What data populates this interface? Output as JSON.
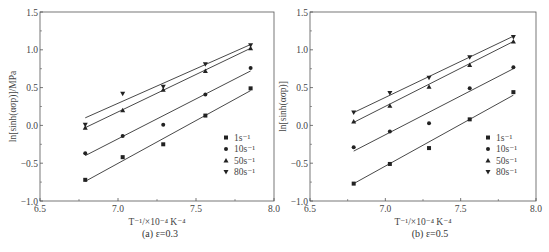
{
  "chart_data": [
    {
      "type": "scatter",
      "panel": "(a)",
      "caption": "(a) ε=0.3",
      "title": "",
      "xlabel": "T⁻¹/×10⁻⁴ K⁻⁴",
      "ylabel": "ln[sinh(ασp)]/MPa",
      "xlim": [
        6.5,
        8.0
      ],
      "ylim": [
        -1.0,
        1.5
      ],
      "xticks": [
        "6.5",
        "7.0",
        "7.5",
        "8.0"
      ],
      "yticks": [
        "-1.0",
        "-0.5",
        "0.0",
        "0.5",
        "1.0",
        "1.5"
      ],
      "grid": false,
      "legend_position": "lower right",
      "fit_lines": true,
      "x": [
        6.79,
        7.03,
        7.29,
        7.56,
        7.85
      ],
      "series": [
        {
          "name": "1s⁻¹",
          "marker": "square",
          "values": [
            -0.72,
            -0.42,
            -0.25,
            0.13,
            0.49
          ],
          "fit": [
            -0.74,
            0.46
          ]
        },
        {
          "name": "10s⁻¹",
          "marker": "circle",
          "values": [
            -0.37,
            -0.14,
            0.01,
            0.41,
            0.76
          ],
          "fit": [
            -0.4,
            0.72
          ]
        },
        {
          "name": "50s⁻¹",
          "marker": "triangle-up",
          "values": [
            -0.03,
            0.2,
            0.47,
            0.72,
            1.02
          ],
          "fit": [
            -0.03,
            1.02
          ]
        },
        {
          "name": "80s⁻¹",
          "marker": "triangle-down",
          "values": [
            0.01,
            0.42,
            0.51,
            0.81,
            1.06
          ],
          "fit": [
            0.1,
            1.07
          ]
        }
      ]
    },
    {
      "type": "scatter",
      "panel": "(b)",
      "caption": "(b) ε=0.5",
      "title": "",
      "xlabel": "T⁻¹/×10⁻⁴ K⁻⁴",
      "ylabel": "ln[sinh(ασp)]",
      "xlim": [
        6.5,
        8.0
      ],
      "ylim": [
        -1.0,
        1.5
      ],
      "xticks": [
        "6.5",
        "7.0",
        "7.5",
        "8.0"
      ],
      "yticks": [
        "-1.0",
        "-0.5",
        "0.0",
        "0.5",
        "1.0",
        "1.5"
      ],
      "grid": false,
      "legend_position": "lower right",
      "fit_lines": true,
      "x": [
        6.79,
        7.03,
        7.29,
        7.56,
        7.85
      ],
      "series": [
        {
          "name": "1s⁻¹",
          "marker": "square",
          "values": [
            -0.77,
            -0.51,
            -0.3,
            0.08,
            0.44
          ],
          "fit": [
            -0.77,
            0.4
          ]
        },
        {
          "name": "10s⁻¹",
          "marker": "circle",
          "values": [
            -0.29,
            -0.08,
            0.03,
            0.49,
            0.77
          ],
          "fit": [
            -0.34,
            0.75
          ]
        },
        {
          "name": "50s⁻¹",
          "marker": "triangle-up",
          "values": [
            0.05,
            0.26,
            0.51,
            0.8,
            1.11
          ],
          "fit": [
            0.04,
            1.11
          ]
        },
        {
          "name": "80s⁻¹",
          "marker": "triangle-down",
          "values": [
            0.17,
            0.43,
            0.63,
            0.9,
            1.17
          ],
          "fit": [
            0.17,
            1.18
          ]
        }
      ]
    }
  ]
}
